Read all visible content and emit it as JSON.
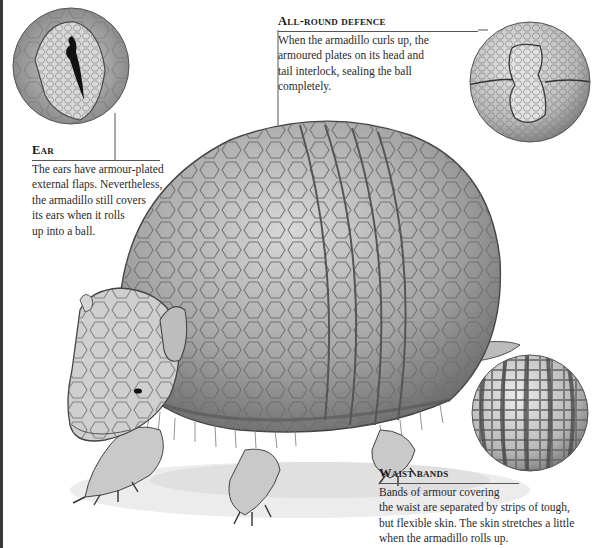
{
  "figure": {
    "callouts": [
      {
        "id": "ear",
        "title": "Ear",
        "text": "The ears have armour-plated external flaps. Nevertheless, the armadillo still covers its ears when it rolls up into a ball.",
        "lines": [
          "The ears have armour-plated",
          "external flaps. Nevertheless,",
          "the armadillo still covers",
          "its ears when it rolls",
          "up into a ball."
        ]
      },
      {
        "id": "defence",
        "title": "All-round defence",
        "text": "When the armadillo curls up, the armoured plates on its head and tail interlock, sealing the ball completely.",
        "lines": [
          "When the armadillo curls up, the",
          "armoured plates on its head and",
          "tail interlock, sealing the ball",
          "completely."
        ]
      },
      {
        "id": "waist",
        "title": "Waist bands",
        "text": "Bands of armour covering the waist are separated by strips of tough, but flexible skin. The skin stretches a little when the armadillo rolls up.",
        "lines": [
          "Bands of armour covering",
          "the waist are separated by strips of tough,",
          "but flexible skin. The skin stretches a little",
          "when the armadillo rolls up."
        ]
      }
    ],
    "colors": {
      "ink": "#2a2a2a",
      "shell": "#9a9a9a",
      "paper": "#ffffff"
    }
  }
}
